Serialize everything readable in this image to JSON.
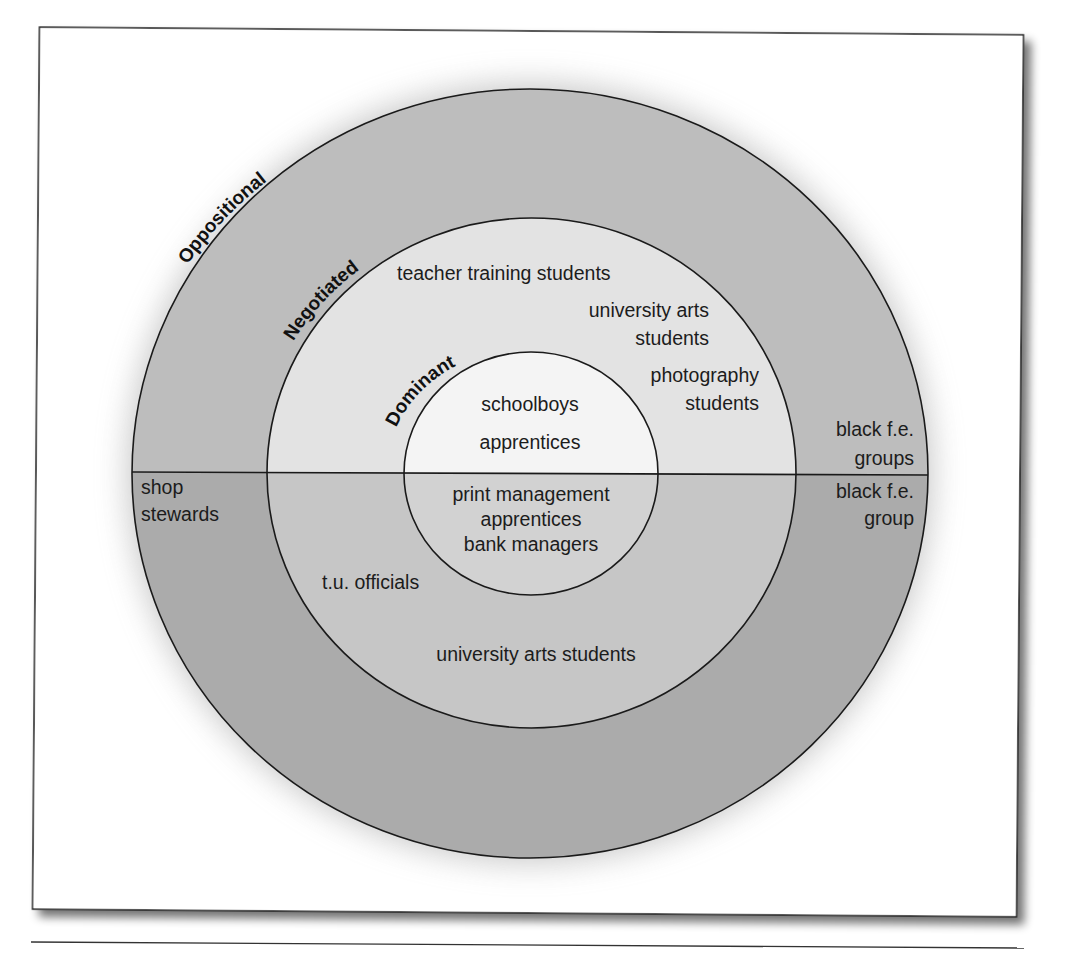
{
  "diagram": {
    "type": "concentric-circles",
    "rings": {
      "outer": {
        "label": "Oppositional"
      },
      "middle": {
        "label": "Negotiated"
      },
      "inner": {
        "label": "Dominant"
      }
    },
    "upper_half": {
      "outer": [
        "black f.e.",
        "groups"
      ],
      "middle": {
        "item1": "teacher training students",
        "item2_line1": "university arts",
        "item2_line2": "students",
        "item3_line1": "photography",
        "item3_line2": "students"
      },
      "inner": [
        "schoolboys",
        "apprentices"
      ]
    },
    "lower_half": {
      "outer_left": [
        "shop",
        "stewards"
      ],
      "outer_right": [
        "black f.e.",
        "group"
      ],
      "middle": [
        "t.u. officials",
        "university arts students"
      ],
      "inner": [
        "print management",
        "apprentices",
        "bank managers"
      ]
    },
    "colors": {
      "outer_top": "#bdbdbd",
      "outer_bottom": "#ababab",
      "middle_top": "#e3e3e3",
      "middle_bottom": "#c6c6c6",
      "inner_top": "#f4f4f4",
      "inner_bottom": "#d2d2d2",
      "stroke": "#1a1a1a",
      "frame": "#222222"
    }
  }
}
